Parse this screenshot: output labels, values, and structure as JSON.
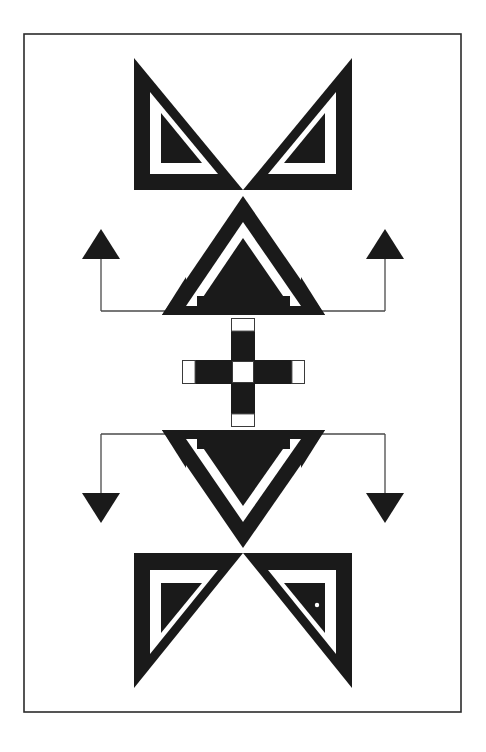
{
  "canvas": {
    "width": 486,
    "height": 752,
    "background_color": "#ffffff",
    "title": "Symmetric black-and-white geometric emblem"
  },
  "frame": {
    "name": "border-rectangle",
    "x": 24,
    "y": 34,
    "width": 437,
    "height": 678,
    "stroke_color": "#2b2b2b",
    "stroke_width": 1.6,
    "fill": "none"
  },
  "palette": {
    "ink": "#1a1a1a",
    "paper": "#ffffff",
    "frame_line": "#2b2b2b",
    "connector_line": "#4a4a4a"
  },
  "motifs": {
    "top_wings": {
      "label": "top butterfly wings",
      "apex_x": 243,
      "apex_y": 190,
      "left_tip_x": 134,
      "left_tip_y": 58,
      "right_tip_x": 352,
      "right_tip_y": 58,
      "baseline_y": 190,
      "left_outer_x": 134,
      "right_outer_x": 352
    },
    "bottom_wings": {
      "label": "bottom butterfly wings",
      "apex_x": 243,
      "apex_y": 553,
      "left_tip_x": 134,
      "left_tip_y": 688,
      "right_tip_x": 352,
      "right_tip_y": 688,
      "baseline_y": 553
    },
    "upper_triangle": {
      "label": "central upward triangle",
      "apex_x": 243,
      "apex_y": 196,
      "left_x": 162,
      "right_x": 325,
      "base_y": 315
    },
    "lower_triangle": {
      "label": "central downward triangle",
      "apex_x": 243,
      "apex_y": 548,
      "left_x": 162,
      "right_x": 325,
      "base_y": 430
    },
    "cross": {
      "label": "central cross with white caps",
      "center_x": 243,
      "center_y": 372,
      "arm_thickness": 24,
      "horizontal_left": 182,
      "horizontal_right": 305,
      "vertical_top": 318,
      "vertical_bottom": 427,
      "cap_size": 16,
      "center_square": 22
    },
    "connectors": {
      "upper_bracket_y": 311,
      "lower_bracket_y": 434,
      "left_stem_x": 101,
      "right_stem_x": 385,
      "arrow_width": 38,
      "arrow_height": 30,
      "top_arrowhead_y": 229,
      "bottom_arrowhead_y": 523,
      "line_width": 1.3
    }
  },
  "annotations": {
    "speck": {
      "label": "ink-speck artifact",
      "cx": 317,
      "cy": 605,
      "r": 2.2,
      "color": "#ffffff"
    }
  },
  "arrows": [
    {
      "name": "arrow-top-left",
      "direction": "up",
      "tip_x": 101,
      "tip_y": 229
    },
    {
      "name": "arrow-top-right",
      "direction": "up",
      "tip_x": 385,
      "tip_y": 229
    },
    {
      "name": "arrow-bottom-left",
      "direction": "down",
      "tip_x": 101,
      "tip_y": 523
    },
    {
      "name": "arrow-bottom-right",
      "direction": "down",
      "tip_x": 385,
      "tip_y": 523
    }
  ]
}
